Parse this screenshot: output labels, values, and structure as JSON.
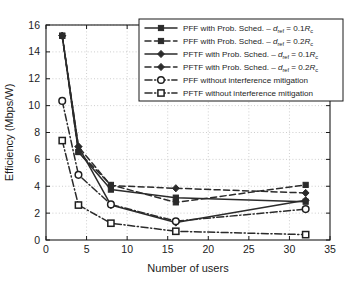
{
  "chart_data": {
    "type": "line",
    "title": "",
    "xlabel": "Number of users",
    "ylabel": "Efficiency (Mbps/W)",
    "xlim": [
      0,
      35
    ],
    "ylim": [
      0,
      16
    ],
    "xticks": [
      0,
      5,
      10,
      15,
      20,
      25,
      30,
      35
    ],
    "yticks": [
      0,
      2,
      4,
      6,
      8,
      10,
      12,
      14,
      16
    ],
    "grid": true,
    "legend_position": "upper right",
    "x": [
      2,
      4,
      8,
      16,
      32
    ],
    "series": [
      {
        "name": "PFF with Prob. Sched. – d_ref = 0.1R_c",
        "label_main": "PFF with Prob. Sched. – ",
        "label_var": "d",
        "label_sub": "ref",
        "label_tail": " = 0.1",
        "label_r": "R",
        "label_rsub": "c",
        "linestyle": "solid",
        "marker": "filled-square",
        "values": [
          15.2,
          6.55,
          3.75,
          3.15,
          2.85
        ]
      },
      {
        "name": "PFF with Prob. Sched. – d_ref = 0.2R_c",
        "label_main": "PFF with Prob. Sched. – ",
        "label_var": "d",
        "label_sub": "ref",
        "label_tail": " = 0.2",
        "label_r": "R",
        "label_rsub": "c",
        "linestyle": "dashed",
        "marker": "filled-square",
        "values": [
          15.2,
          6.55,
          4.1,
          2.8,
          4.1
        ]
      },
      {
        "name": "PFTF with Prob. Sched. – d_ref = 0.1R_c",
        "label_main": "PFTF with Prob. Sched. – ",
        "label_var": "d",
        "label_sub": "ref",
        "label_tail": " = 0.1",
        "label_r": "R",
        "label_rsub": "c",
        "linestyle": "solid",
        "marker": "filled-diamond",
        "values": [
          15.2,
          6.95,
          2.6,
          1.3,
          2.95
        ]
      },
      {
        "name": "PFTF with Prob. Sched. – d_ref = 0.2R_c",
        "label_main": "PFTF with Prob. Sched. – ",
        "label_var": "d",
        "label_sub": "ref",
        "label_tail": " = 0.2",
        "label_r": "R",
        "label_rsub": "c",
        "linestyle": "dashed",
        "marker": "filled-diamond",
        "values": [
          15.2,
          6.95,
          4.05,
          3.85,
          3.5
        ]
      },
      {
        "name": "PFF without interference mitigation",
        "label_main": "PFF without interference mitigation",
        "label_var": "",
        "label_sub": "",
        "label_tail": "",
        "label_r": "",
        "label_rsub": "",
        "linestyle": "dashdot",
        "marker": "open-circle",
        "values": [
          10.35,
          4.85,
          2.65,
          1.4,
          2.3
        ]
      },
      {
        "name": "PFTF without interference mitigation",
        "label_main": "PFTF without interference mitigation",
        "label_var": "",
        "label_sub": "",
        "label_tail": "",
        "label_r": "",
        "label_rsub": "",
        "linestyle": "dashdot",
        "marker": "open-square",
        "values": [
          7.4,
          2.6,
          1.25,
          0.65,
          0.4
        ]
      }
    ]
  },
  "colors": {
    "line": "#2b2b2b",
    "axis": "#1a1a1a",
    "grid": "#b9b9b9",
    "background": "#ffffff"
  }
}
